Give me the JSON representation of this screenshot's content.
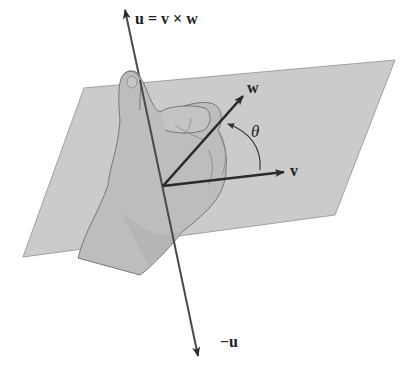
{
  "diagram": {
    "title_label": "u = v × w",
    "labels": {
      "u_eq": "u = v × w",
      "w": "w",
      "v": "v",
      "theta": "θ",
      "neg_u": "−u"
    },
    "colors": {
      "plane": "#c8c8c8",
      "plane_edge": "#9a9a9a",
      "hand": "#bdbdbd",
      "hand_outline": "#7a7a7a",
      "vector": "#2a2a2a",
      "axis": "#4a4a4a"
    },
    "elements": [
      "plane",
      "right-hand",
      "u-axis",
      "v-vector",
      "w-vector",
      "theta-arc"
    ]
  }
}
